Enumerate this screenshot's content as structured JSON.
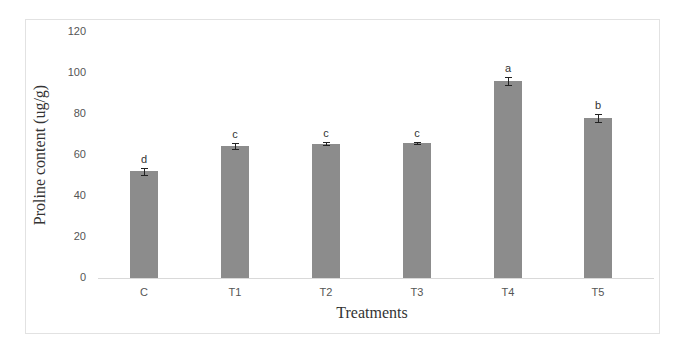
{
  "chart_data": {
    "type": "bar",
    "title": "",
    "xlabel": "Treatments",
    "ylabel": "Proline content (ug/g)",
    "ylim": [
      0,
      120
    ],
    "yticks": [
      0,
      20,
      40,
      60,
      80,
      100,
      120
    ],
    "grid": false,
    "legend": null,
    "categories": [
      "C",
      "T1",
      "T2",
      "T3",
      "T4",
      "T5"
    ],
    "values": [
      52,
      64.5,
      65.5,
      66,
      96,
      78
    ],
    "error": [
      1.8,
      1.5,
      0.6,
      0.5,
      2,
      1.8
    ],
    "significance_letters": [
      "d",
      "c",
      "c",
      "c",
      "a",
      "b"
    ],
    "bar_color": "#8c8c8c"
  }
}
